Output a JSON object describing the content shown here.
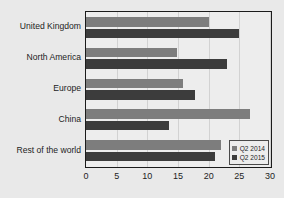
{
  "chart_data": {
    "type": "bar",
    "orientation": "horizontal",
    "title": "",
    "xlabel": "",
    "ylabel": "",
    "xlim": [
      0,
      30
    ],
    "xticks": [
      "0",
      "5",
      "10",
      "15",
      "20",
      "25",
      "30"
    ],
    "grid": true,
    "legend_position": "lower right",
    "categories": [
      "United Kingdom",
      "North America",
      "Europe",
      "China",
      "Rest of the world"
    ],
    "series": [
      {
        "name": "Q2 2014",
        "color": "#7d7d7d",
        "values": [
          20.0,
          14.8,
          15.8,
          26.8,
          22.0
        ]
      },
      {
        "name": "Q2 2015",
        "color": "#3c3c3c",
        "values": [
          25.0,
          23.0,
          17.8,
          13.5,
          21.0
        ]
      }
    ]
  },
  "legend": {
    "items": [
      {
        "label": "Q2 2014"
      },
      {
        "label": "Q2 2015"
      }
    ]
  },
  "caption": {
    "text": ""
  },
  "colors": {
    "series_2014": "#7d7d7d",
    "series_2015": "#3c3c3c",
    "background": "#e9e9e9",
    "plot_background": "#ededed",
    "axis": "#1b1b1b"
  }
}
